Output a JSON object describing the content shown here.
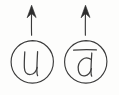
{
  "figure": {
    "background_color": "#fdfdfc",
    "ink_color": "#3a3a3a",
    "style": "hand-drawn sketch",
    "width": 119,
    "height": 95
  },
  "particles": [
    {
      "id": "left",
      "label": "u",
      "label_reading": "up quark",
      "has_overbar": false,
      "spin_arrow": "up",
      "spin_arrow_glyph": "↑",
      "circle": {
        "cx": 32,
        "cy": 62,
        "r": 21.5
      },
      "arrow": {
        "x": 31.5,
        "y_top": 6,
        "y_bottom": 35
      }
    },
    {
      "id": "right",
      "label": "d",
      "label_reading": "anti-down quark",
      "has_overbar": true,
      "spin_arrow": "up",
      "spin_arrow_glyph": "↑",
      "circle": {
        "cx": 85.5,
        "cy": 62,
        "r": 21.5
      },
      "arrow": {
        "x": 85.5,
        "y_top": 6,
        "y_bottom": 35
      }
    }
  ]
}
